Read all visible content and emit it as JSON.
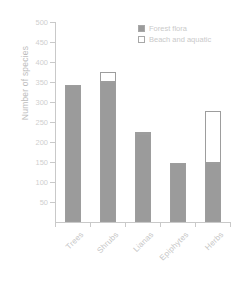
{
  "chart_data": {
    "type": "bar",
    "subtype": "stacked-bar",
    "title": "",
    "xlabel": "",
    "ylabel": "Number of species",
    "ylim": [
      0,
      500
    ],
    "ytick_step": 50,
    "yticks": [
      500,
      450,
      400,
      350,
      300,
      250,
      200,
      150,
      100,
      50
    ],
    "grid": false,
    "legend_position": "top-right",
    "categories": [
      "Trees",
      "Shrubs",
      "Lianas",
      "Epiphytes",
      "Herbs"
    ],
    "series": [
      {
        "name": "Forest flora",
        "color": "#9b9b9b",
        "values": [
          342,
          350,
          220,
          148,
          148
        ]
      },
      {
        "name": "Beach and aquatic",
        "color": "#ffffff",
        "values": [
          0,
          25,
          5,
          0,
          130
        ]
      }
    ],
    "totals": [
      342,
      375,
      225,
      148,
      278
    ]
  },
  "legend": {
    "items": [
      {
        "label": "Forest flora",
        "swatch": "filled-gray-swatch"
      },
      {
        "label": "Beach and aquatic",
        "swatch": "empty-white-swatch"
      }
    ]
  }
}
